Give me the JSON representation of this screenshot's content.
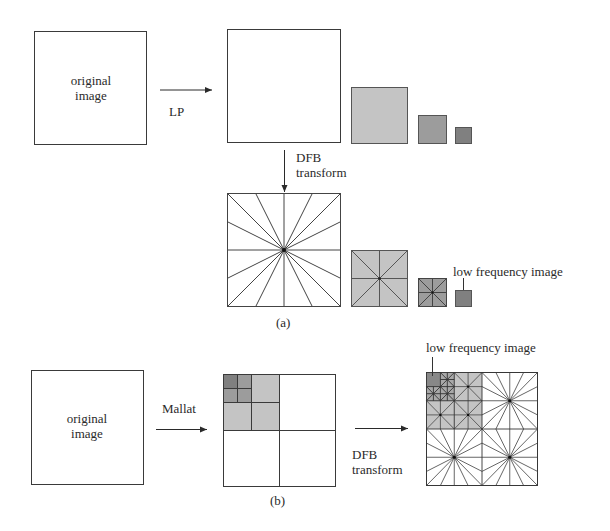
{
  "figure": {
    "panel_a": {
      "caption": "(a)",
      "original_box_label_line1": "original",
      "original_box_label_line2": "image",
      "lp_arrow_label": "LP",
      "dfb_arrow_label_line1": "DFB",
      "dfb_arrow_label_line2": "transform",
      "low_freq_label": "low frequency image",
      "pyramid_levels": 3,
      "dfb_directions_level1": 16,
      "dfb_directions_level2": 8,
      "dfb_directions_level3": 8
    },
    "panel_b": {
      "caption": "(b)",
      "original_box_label_line1": "original",
      "original_box_label_line2": "image",
      "mallat_arrow_label": "Mallat",
      "dfb_arrow_label_line1": "DFB",
      "dfb_arrow_label_line2": "transform",
      "low_freq_label": "low frequency image"
    },
    "colors": {
      "line": "#3a3a3a",
      "gray_light": "#c4c4c4",
      "gray_mid": "#9c9c9c",
      "gray_dark": "#808080",
      "background": "#ffffff"
    }
  }
}
